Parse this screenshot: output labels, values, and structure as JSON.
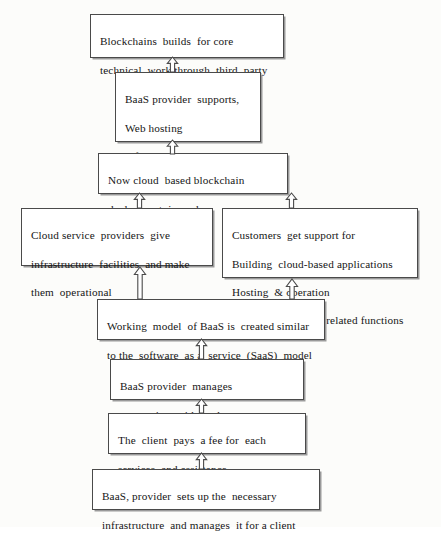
{
  "diagram": {
    "direction": "bottom-to-top",
    "style": {
      "background": "#fcfcfa",
      "box_fill": "#ffffff",
      "box_border": "#4a4a4a",
      "box_shadow": "#9a9a9a",
      "text_color": "#151515",
      "arrow_fill": "#ffffff",
      "arrow_stroke": "#4b4b4b"
    },
    "nodes": [
      {
        "id": "blockchains",
        "lines": [
          "Blockchains  builds  for core",
          "technical  work through  third  party"
        ]
      },
      {
        "id": "baas-supports",
        "lines": [
          "BaaS provider  supports,",
          "Web hosting",
          "Infrastructure",
          "Maintenance"
        ]
      },
      {
        "id": "cloud-ready",
        "lines": [
          "Now cloud  based blockchain",
          "deployment  is ready"
        ]
      },
      {
        "id": "cloud-providers",
        "lines": [
          "Cloud service  providers  give",
          "infrastructure  facilities  and make",
          "them  operational"
        ]
      },
      {
        "id": "customers",
        "lines": [
          "Customers  get support for",
          "Building  cloud-based applications",
          "Hosting  & operation",
          "Blockchain  apps & related functions"
        ]
      },
      {
        "id": "working-model",
        "lines": [
          "Working  model  of BaaS is  created similar",
          "to the  software  as a  service  (SaaS)  model"
        ]
      },
      {
        "id": "manages-conn",
        "lines": [
          "BaaS provider  manages",
          "connection  with  nodes"
        ]
      },
      {
        "id": "client-fee",
        "lines": [
          "The  client  pays  a fee for  each",
          "services  and assistance"
        ]
      },
      {
        "id": "baas-sets-up",
        "lines": [
          "BaaS, provider  sets up the  necessary",
          "infrastructure  and manages  it for a client"
        ]
      }
    ],
    "arrows": [
      {
        "id": "arrow-1",
        "from": "baas-supports",
        "to": "blockchains",
        "direction": "up"
      },
      {
        "id": "arrow-2",
        "from": "cloud-ready",
        "to": "baas-supports",
        "direction": "up"
      },
      {
        "id": "arrow-5",
        "from": "cloud-providers",
        "to": "cloud-ready",
        "direction": "up"
      },
      {
        "id": "arrow-6",
        "from": "customers",
        "to": "cloud-ready",
        "direction": "up"
      },
      {
        "id": "arrow-3",
        "from": "working-model",
        "to": "cloud-providers",
        "direction": "up"
      },
      {
        "id": "arrow-4",
        "from": "working-model",
        "to": "customers",
        "direction": "up"
      },
      {
        "id": "arrow-7",
        "from": "manages-conn",
        "to": "working-model",
        "direction": "up"
      },
      {
        "id": "arrow-8",
        "from": "client-fee",
        "to": "manages-conn",
        "direction": "up"
      },
      {
        "id": "arrow-9",
        "from": "baas-sets-up",
        "to": "client-fee",
        "direction": "up"
      }
    ]
  }
}
